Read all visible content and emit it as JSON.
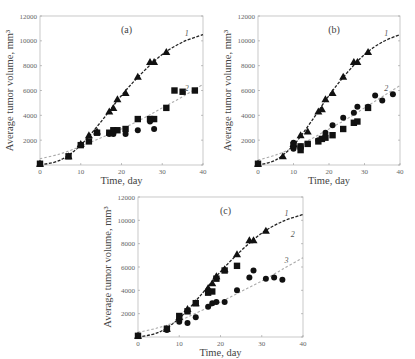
{
  "figure": {
    "ylabel": "Average tumor volume, mm³",
    "xlabel": "Time, day"
  },
  "chart_data": [
    {
      "type": "scatter",
      "panel": "(a)",
      "xlabel": "Time, day",
      "ylabel": "Average tumor volume, mm³",
      "xlim": [
        0,
        40
      ],
      "ylim": [
        0,
        12000
      ],
      "xticks": [
        0,
        10,
        20,
        30,
        40
      ],
      "yticks": [
        0,
        2000,
        4000,
        6000,
        8000,
        10000,
        12000
      ],
      "curve_labels": [
        "1",
        "2"
      ],
      "series": [
        {
          "name": "triangles",
          "marker": "triangle",
          "x": [
            0,
            7,
            10,
            12,
            14,
            17,
            18,
            19,
            21,
            24,
            27,
            28,
            31
          ],
          "y": [
            100,
            700,
            1700,
            2400,
            2700,
            4300,
            4600,
            5300,
            5800,
            7100,
            8300,
            8300,
            9100
          ]
        },
        {
          "name": "squares",
          "marker": "square",
          "x": [
            0,
            7,
            10,
            12,
            14,
            17,
            18,
            19,
            21,
            24,
            27,
            28,
            31,
            33,
            35,
            38
          ],
          "y": [
            100,
            700,
            1600,
            1900,
            2600,
            2600,
            2800,
            2800,
            2900,
            3700,
            3700,
            3700,
            4600,
            6000,
            5900,
            6000
          ]
        },
        {
          "name": "circles",
          "marker": "circle",
          "x": [
            0,
            17,
            18,
            21,
            24,
            27,
            28
          ],
          "y": [
            100,
            2500,
            2500,
            2500,
            2800,
            3500,
            2900
          ]
        },
        {
          "name": "curve 1",
          "style": "dashed-dark",
          "x": [
            0,
            5,
            10,
            15,
            20,
            25,
            30,
            35,
            40
          ],
          "y": [
            0,
            400,
            1600,
            3500,
            5600,
            7400,
            8900,
            9900,
            10500
          ]
        },
        {
          "name": "curve 2",
          "style": "dashed-light",
          "x": [
            0,
            5,
            10,
            15,
            20,
            25,
            30,
            35,
            40
          ],
          "y": [
            500,
            900,
            1500,
            2200,
            2900,
            3700,
            4600,
            5500,
            6500
          ]
        }
      ]
    },
    {
      "type": "scatter",
      "panel": "(b)",
      "xlabel": "Time, day",
      "ylabel": "Average tumor volume, mm³",
      "xlim": [
        0,
        40
      ],
      "ylim": [
        0,
        12000
      ],
      "xticks": [
        0,
        10,
        20,
        30,
        40
      ],
      "yticks": [
        0,
        2000,
        4000,
        6000,
        8000,
        10000,
        12000
      ],
      "curve_labels": [
        "1",
        "2"
      ],
      "series": [
        {
          "name": "triangles",
          "marker": "triangle",
          "x": [
            0,
            7,
            10,
            12,
            14,
            17,
            18,
            19,
            21,
            24,
            27,
            28,
            31
          ],
          "y": [
            100,
            700,
            1700,
            2400,
            2700,
            4300,
            4500,
            5300,
            5800,
            7100,
            8300,
            8300,
            9100
          ]
        },
        {
          "name": "circles",
          "marker": "circle",
          "x": [
            0,
            10,
            10,
            12,
            14,
            17,
            19,
            21,
            24,
            27,
            28,
            31,
            33,
            35,
            38
          ],
          "y": [
            100,
            1800,
            1300,
            1500,
            1700,
            2000,
            2600,
            3200,
            3800,
            4200,
            4700,
            4700,
            5600,
            5200,
            5700
          ]
        },
        {
          "name": "squares",
          "marker": "square",
          "x": [
            0,
            10,
            12,
            12,
            14,
            17,
            18,
            19,
            21,
            24,
            27,
            28,
            31
          ],
          "y": [
            100,
            1600,
            1500,
            1200,
            1700,
            1900,
            2100,
            2200,
            2400,
            2900,
            3400,
            3500,
            4600
          ]
        },
        {
          "name": "curve 1",
          "style": "dashed-dark",
          "x": [
            0,
            5,
            10,
            15,
            20,
            25,
            30,
            35,
            40
          ],
          "y": [
            0,
            400,
            1600,
            3500,
            5600,
            7400,
            8900,
            9900,
            10500
          ]
        },
        {
          "name": "curve 2",
          "style": "dashed-light",
          "x": [
            0,
            5,
            10,
            15,
            20,
            25,
            30,
            35,
            40
          ],
          "y": [
            400,
            800,
            1400,
            2100,
            2900,
            3700,
            4600,
            5500,
            6400
          ]
        }
      ]
    },
    {
      "type": "scatter",
      "panel": "(c)",
      "xlabel": "Time, day",
      "ylabel": "Average tumor volume, mm³",
      "xlim": [
        0,
        40
      ],
      "ylim": [
        0,
        12000
      ],
      "xticks": [
        0,
        10,
        20,
        30,
        40
      ],
      "yticks": [
        0,
        2000,
        4000,
        6000,
        8000,
        10000,
        12000
      ],
      "curve_labels": [
        "1",
        "2",
        "3"
      ],
      "series": [
        {
          "name": "triangles",
          "marker": "triangle",
          "x": [
            0,
            7,
            10,
            12,
            14,
            17,
            18,
            19,
            21,
            24,
            27,
            28,
            31
          ],
          "y": [
            100,
            700,
            1700,
            2400,
            2900,
            4200,
            4600,
            5200,
            5800,
            7100,
            8300,
            8300,
            9100
          ]
        },
        {
          "name": "squares",
          "marker": "square",
          "x": [
            0,
            7,
            10,
            12,
            14,
            17,
            18,
            19,
            21,
            24
          ],
          "y": [
            100,
            700,
            1800,
            2200,
            2900,
            3800,
            3900,
            5000,
            5700,
            6100
          ]
        },
        {
          "name": "circles",
          "marker": "circle",
          "x": [
            0,
            7,
            10,
            12,
            14,
            17,
            18,
            19,
            21,
            24,
            27,
            28,
            31,
            33,
            35
          ],
          "y": [
            100,
            600,
            1300,
            1200,
            1700,
            2600,
            2900,
            3000,
            3000,
            4000,
            5100,
            5700,
            5000,
            5100,
            4900
          ]
        },
        {
          "name": "curve 1",
          "style": "dashed-dark",
          "x": [
            0,
            5,
            10,
            15,
            20,
            25,
            30,
            35,
            40
          ],
          "y": [
            0,
            400,
            1600,
            3500,
            5600,
            7400,
            8900,
            9900,
            10500
          ]
        },
        {
          "name": "curve 3",
          "style": "dashed-light",
          "x": [
            0,
            5,
            10,
            15,
            20,
            25,
            30,
            35,
            40
          ],
          "y": [
            400,
            800,
            1400,
            2200,
            3000,
            3900,
            4800,
            5800,
            6800
          ]
        }
      ]
    }
  ],
  "panels_layout": [
    {
      "label": "(a)",
      "x0": 40,
      "x1": 203,
      "y0": 165,
      "y1": 16
    },
    {
      "label": "(b)",
      "x0": 258,
      "x1": 400,
      "y0": 165,
      "y1": 16
    },
    {
      "label": "(c)",
      "x0": 138,
      "x1": 303,
      "y0": 337,
      "y1": 197
    }
  ],
  "colors": {
    "marker": "#111111",
    "curve_dark": "#222222",
    "curve_light": "#aaaaaa",
    "axis": "#bbbbbb",
    "text": "#444444"
  }
}
